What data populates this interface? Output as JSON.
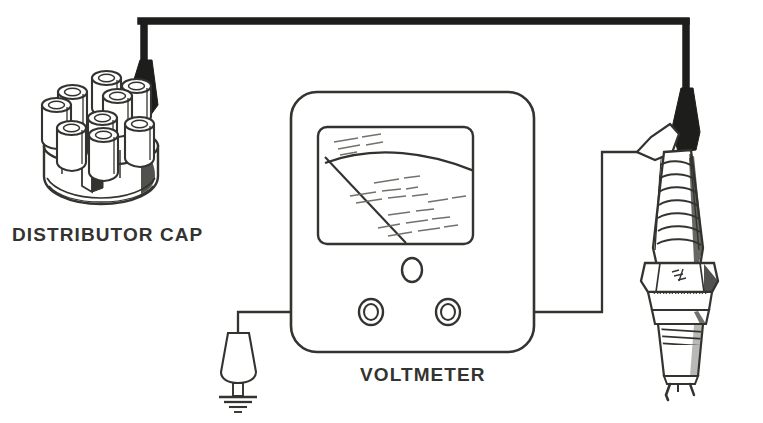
{
  "figure": {
    "type": "line-art technical diagram",
    "background_color": "#ffffff",
    "ink_color": "#33332f",
    "heavy_wire_color": "#1d1d1b"
  },
  "labels": {
    "distributor_cap": "DISTRIBUTOR CAP",
    "voltmeter": "VOLTMETER"
  },
  "components": {
    "distributor_cap": {
      "name": "distributor cap",
      "tower_count": 9,
      "outer_towers": 8,
      "center_towers": 1,
      "label": "DISTRIBUTOR CAP"
    },
    "voltmeter": {
      "name": "voltmeter",
      "label": "VOLTMETER",
      "needle_present": true,
      "knob_count": 1,
      "terminal_count": 2,
      "terminals": [
        "left-terminal",
        "right-terminal"
      ]
    },
    "spark_plug": {
      "name": "spark plug",
      "has_insulator_ribs": true,
      "has_hex_nut": true,
      "has_knurled_band": true,
      "has_threads": true,
      "has_ground_electrode": true
    },
    "ground_probe": {
      "name": "ground probe",
      "symbol": "earth-ground"
    },
    "plug_probe": {
      "name": "spark plug probe clip"
    },
    "ignition_wire": {
      "name": "ignition wire",
      "from": "distributor cap",
      "to": "spark plug"
    },
    "test_lead_left": {
      "name": "left test lead",
      "from": "voltmeter left terminal",
      "to": "ground probe"
    },
    "test_lead_right": {
      "name": "right test lead",
      "from": "voltmeter right terminal",
      "to": "spark plug probe"
    }
  }
}
